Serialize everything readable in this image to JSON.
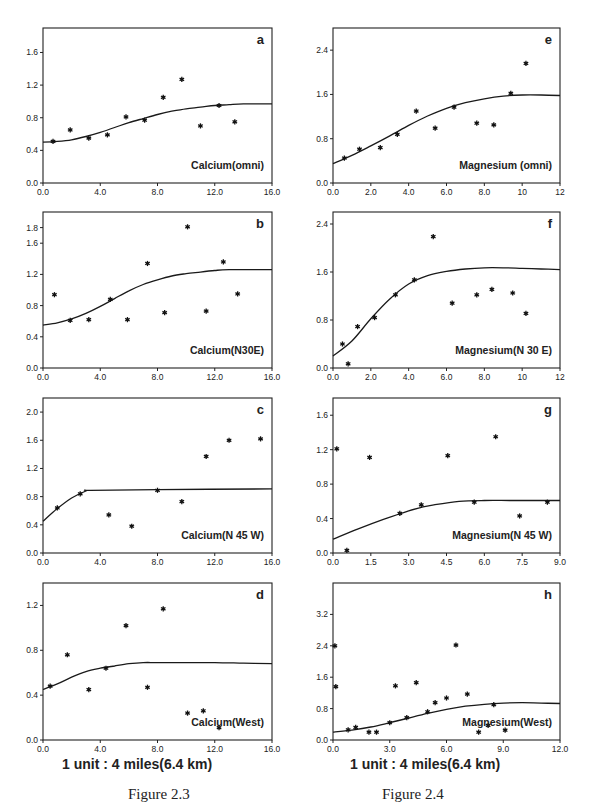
{
  "captions": {
    "left_scale": "1 unit : 4 miles(6.4 km)",
    "right_scale": "1 unit : 4 miles(6.4 km)",
    "left_figure": "Figure 2.3",
    "right_figure": "Figure 2.4"
  },
  "chart_data": [
    {
      "id": "a",
      "type": "scatter",
      "title": "Calcium(omni)",
      "panel_label": "a",
      "box": {
        "x0": 43,
        "x1": 272,
        "y_top": 28,
        "y_bottom": 183
      },
      "xlim": [
        0,
        16
      ],
      "ylim": [
        0,
        1.9
      ],
      "xticks": [
        0,
        4,
        8,
        12,
        16
      ],
      "xtick_labels": [
        "0.0",
        "4.0",
        "8.0",
        "12.0",
        "16.0"
      ],
      "yticks": [
        0,
        0.4,
        0.8,
        1.2,
        1.6
      ],
      "ytick_labels": [
        "0.0",
        "0.4",
        "0.8",
        "1.2",
        "1.6"
      ],
      "points": [
        [
          0.7,
          0.51
        ],
        [
          1.9,
          0.65
        ],
        [
          3.2,
          0.55
        ],
        [
          4.5,
          0.59
        ],
        [
          5.8,
          0.81
        ],
        [
          7.1,
          0.77
        ],
        [
          8.4,
          1.05
        ],
        [
          9.7,
          1.27
        ],
        [
          11.0,
          0.7
        ],
        [
          12.3,
          0.95
        ],
        [
          13.4,
          0.75
        ]
      ],
      "curve": [
        [
          0,
          0.5
        ],
        [
          1,
          0.51
        ],
        [
          2,
          0.53
        ],
        [
          3,
          0.57
        ],
        [
          4,
          0.62
        ],
        [
          5,
          0.68
        ],
        [
          6,
          0.74
        ],
        [
          7,
          0.79
        ],
        [
          8,
          0.84
        ],
        [
          9,
          0.88
        ],
        [
          10,
          0.91
        ],
        [
          11,
          0.93
        ],
        [
          12,
          0.95
        ],
        [
          13,
          0.96
        ],
        [
          14,
          0.97
        ],
        [
          16,
          0.97
        ]
      ]
    },
    {
      "id": "b",
      "type": "scatter",
      "title": "Calcium(N30E)",
      "panel_label": "b",
      "box": {
        "x0": 43,
        "x1": 272,
        "y_top": 212,
        "y_bottom": 368
      },
      "xlim": [
        0,
        16
      ],
      "ylim": [
        0,
        2.0
      ],
      "xticks": [
        0,
        4,
        8,
        12,
        16
      ],
      "xtick_labels": [
        "0.0",
        "4.0",
        "8.0",
        "12.0",
        "16.0"
      ],
      "yticks": [
        0,
        0.4,
        0.8,
        1.2,
        1.6,
        1.8
      ],
      "ytick_labels": [
        "0.0",
        "0.4",
        "0.8",
        "1.2",
        "1.6",
        "1.8"
      ],
      "points": [
        [
          0.8,
          0.94
        ],
        [
          1.9,
          0.61
        ],
        [
          3.2,
          0.62
        ],
        [
          4.7,
          0.88
        ],
        [
          5.9,
          0.62
        ],
        [
          7.3,
          1.34
        ],
        [
          8.5,
          0.71
        ],
        [
          10.1,
          1.81
        ],
        [
          11.4,
          0.73
        ],
        [
          12.6,
          1.36
        ],
        [
          13.6,
          0.95
        ]
      ],
      "curve": [
        [
          0,
          0.55
        ],
        [
          1,
          0.58
        ],
        [
          2,
          0.63
        ],
        [
          3,
          0.7
        ],
        [
          4,
          0.79
        ],
        [
          5,
          0.89
        ],
        [
          6,
          0.99
        ],
        [
          7,
          1.07
        ],
        [
          8,
          1.13
        ],
        [
          9,
          1.18
        ],
        [
          10,
          1.21
        ],
        [
          11,
          1.23
        ],
        [
          12,
          1.25
        ],
        [
          13,
          1.26
        ],
        [
          16,
          1.26
        ]
      ]
    },
    {
      "id": "c",
      "type": "scatter",
      "title": "Calcium(N 45 W)",
      "panel_label": "c",
      "box": {
        "x0": 43,
        "x1": 272,
        "y_top": 398,
        "y_bottom": 553
      },
      "xlim": [
        0,
        16
      ],
      "ylim": [
        0,
        2.2
      ],
      "xticks": [
        0,
        4,
        8,
        12,
        16
      ],
      "xtick_labels": [
        "0.0",
        "4.0",
        "8.0",
        "12.0",
        "16.0"
      ],
      "yticks": [
        0,
        0.4,
        0.8,
        1.2,
        1.6,
        2.0
      ],
      "ytick_labels": [
        "0.0",
        "0.4",
        "0.8",
        "1.2",
        "1.6",
        "2.0"
      ],
      "points": [
        [
          1.0,
          0.64
        ],
        [
          2.6,
          0.84
        ],
        [
          4.6,
          0.54
        ],
        [
          6.2,
          0.38
        ],
        [
          8.0,
          0.89
        ],
        [
          9.7,
          0.73
        ],
        [
          11.4,
          1.37
        ],
        [
          13.0,
          1.6
        ],
        [
          15.2,
          1.62
        ]
      ],
      "curve": [
        [
          0,
          0.45
        ],
        [
          1,
          0.63
        ],
        [
          2,
          0.78
        ],
        [
          3,
          0.88
        ],
        [
          3.3,
          0.89
        ],
        [
          8,
          0.9
        ],
        [
          16,
          0.91
        ]
      ]
    },
    {
      "id": "d",
      "type": "scatter",
      "title": "Calcium(West)",
      "panel_label": "d",
      "box": {
        "x0": 43,
        "x1": 272,
        "y_top": 583,
        "y_bottom": 740
      },
      "xlim": [
        0,
        16
      ],
      "ylim": [
        0,
        1.4
      ],
      "xticks": [
        0,
        4,
        8,
        12,
        16
      ],
      "xtick_labels": [
        "0.0",
        "4.0",
        "8.0",
        "12.0",
        "16.0"
      ],
      "yticks": [
        0,
        0.4,
        0.8,
        1.2
      ],
      "ytick_labels": [
        "0.0",
        "0.4",
        "0.8",
        "1.2"
      ],
      "points": [
        [
          0.5,
          0.48
        ],
        [
          1.7,
          0.76
        ],
        [
          3.2,
          0.45
        ],
        [
          4.4,
          0.64
        ],
        [
          5.8,
          1.02
        ],
        [
          7.3,
          0.47
        ],
        [
          8.4,
          1.17
        ],
        [
          10.1,
          0.24
        ],
        [
          11.2,
          0.26
        ],
        [
          12.3,
          0.11
        ]
      ],
      "curve": [
        [
          0,
          0.45
        ],
        [
          1,
          0.5
        ],
        [
          2,
          0.56
        ],
        [
          3,
          0.61
        ],
        [
          4,
          0.64
        ],
        [
          5,
          0.66
        ],
        [
          6,
          0.68
        ],
        [
          7,
          0.69
        ],
        [
          8,
          0.69
        ],
        [
          10,
          0.69
        ],
        [
          12,
          0.69
        ],
        [
          14,
          0.685
        ],
        [
          16,
          0.68
        ]
      ]
    },
    {
      "id": "e",
      "type": "scatter",
      "title": "Magnesium (omni)",
      "panel_label": "e",
      "box": {
        "x0": 333,
        "x1": 560,
        "y_top": 28,
        "y_bottom": 183
      },
      "xlim": [
        0,
        12
      ],
      "ylim": [
        0,
        2.8
      ],
      "xticks": [
        0,
        2,
        4,
        6,
        8,
        10,
        12
      ],
      "xtick_labels": [
        "0.0",
        "2.0",
        "4.0",
        "6.0",
        "8.0",
        "10",
        "12"
      ],
      "yticks": [
        0,
        0.8,
        1.6,
        2.4
      ],
      "ytick_labels": [
        "0.0",
        "0.8",
        "1.6",
        "2.4"
      ],
      "points": [
        [
          0.6,
          0.45
        ],
        [
          1.4,
          0.61
        ],
        [
          2.5,
          0.64
        ],
        [
          3.4,
          0.88
        ],
        [
          4.4,
          1.3
        ],
        [
          5.4,
          0.99
        ],
        [
          6.4,
          1.37
        ],
        [
          7.6,
          1.08
        ],
        [
          8.5,
          1.05
        ],
        [
          9.4,
          1.62
        ],
        [
          10.2,
          2.16
        ]
      ],
      "curve": [
        [
          0,
          0.35
        ],
        [
          1,
          0.5
        ],
        [
          2,
          0.67
        ],
        [
          3,
          0.85
        ],
        [
          4,
          1.04
        ],
        [
          5,
          1.21
        ],
        [
          6,
          1.35
        ],
        [
          7,
          1.45
        ],
        [
          8,
          1.52
        ],
        [
          9,
          1.57
        ],
        [
          10,
          1.59
        ],
        [
          11,
          1.59
        ],
        [
          12,
          1.58
        ]
      ]
    },
    {
      "id": "f",
      "type": "scatter",
      "title": "Magnesium(N 30 E)",
      "panel_label": "f",
      "box": {
        "x0": 333,
        "x1": 560,
        "y_top": 212,
        "y_bottom": 368
      },
      "xlim": [
        0,
        12
      ],
      "ylim": [
        0,
        2.6
      ],
      "xticks": [
        0,
        2,
        4,
        6,
        8,
        10,
        12
      ],
      "xtick_labels": [
        "0.0",
        "2.0",
        "4.0",
        "6.0",
        "8.0",
        "10",
        "12"
      ],
      "yticks": [
        0,
        0.8,
        1.6,
        2.4
      ],
      "ytick_labels": [
        "0.0",
        "0.8",
        "1.6",
        "2.4"
      ],
      "points": [
        [
          0.5,
          0.4
        ],
        [
          0.8,
          0.07
        ],
        [
          1.3,
          0.69
        ],
        [
          2.2,
          0.84
        ],
        [
          3.3,
          1.22
        ],
        [
          4.3,
          1.47
        ],
        [
          5.3,
          2.19
        ],
        [
          6.3,
          1.08
        ],
        [
          7.6,
          1.22
        ],
        [
          8.4,
          1.31
        ],
        [
          9.5,
          1.25
        ],
        [
          10.2,
          0.91
        ]
      ],
      "curve": [
        [
          0,
          0.2
        ],
        [
          1,
          0.45
        ],
        [
          2,
          0.82
        ],
        [
          3,
          1.15
        ],
        [
          4,
          1.4
        ],
        [
          5,
          1.54
        ],
        [
          6,
          1.61
        ],
        [
          7,
          1.65
        ],
        [
          8,
          1.67
        ],
        [
          9,
          1.67
        ],
        [
          10,
          1.66
        ],
        [
          11,
          1.65
        ],
        [
          12,
          1.64
        ]
      ]
    },
    {
      "id": "g",
      "type": "scatter",
      "title": "Magnesium(N 45 W)",
      "panel_label": "g",
      "box": {
        "x0": 333,
        "x1": 560,
        "y_top": 398,
        "y_bottom": 553
      },
      "xlim": [
        0,
        9
      ],
      "ylim": [
        0,
        1.8
      ],
      "xticks": [
        0,
        1.5,
        3,
        4.5,
        6,
        7.5,
        9
      ],
      "xtick_labels": [
        "0.0",
        "1.5",
        "3.0",
        "4.5",
        "6.0",
        "7.5",
        "9.0"
      ],
      "yticks": [
        0,
        0.4,
        0.8,
        1.2,
        1.6
      ],
      "ytick_labels": [
        "0.0",
        "0.4",
        "0.8",
        "1.2",
        "1.6"
      ],
      "points": [
        [
          0.15,
          1.21
        ],
        [
          0.55,
          0.03
        ],
        [
          1.45,
          1.11
        ],
        [
          2.65,
          0.46
        ],
        [
          3.5,
          0.56
        ],
        [
          4.55,
          1.13
        ],
        [
          5.6,
          0.59
        ],
        [
          6.45,
          1.35
        ],
        [
          7.4,
          0.43
        ],
        [
          8.5,
          0.59
        ]
      ],
      "curve": [
        [
          0,
          0.16
        ],
        [
          1,
          0.28
        ],
        [
          2,
          0.39
        ],
        [
          3,
          0.49
        ],
        [
          3.5,
          0.53
        ],
        [
          4,
          0.56
        ],
        [
          5,
          0.6
        ],
        [
          6,
          0.61
        ],
        [
          7,
          0.61
        ],
        [
          8,
          0.61
        ],
        [
          9,
          0.61
        ]
      ]
    },
    {
      "id": "h",
      "type": "scatter",
      "title": "Magnesium(West)",
      "panel_label": "h",
      "box": {
        "x0": 333,
        "x1": 560,
        "y_top": 583,
        "y_bottom": 740
      },
      "xlim": [
        0,
        12
      ],
      "ylim": [
        0,
        4.0
      ],
      "xticks": [
        0,
        3,
        6,
        9,
        12
      ],
      "xtick_labels": [
        "0.0",
        "3.0",
        "6.0",
        "9.0",
        "12.0"
      ],
      "yticks": [
        0,
        0.8,
        1.6,
        2.4,
        3.2
      ],
      "ytick_labels": [
        "0.0",
        "0.8",
        "1.6",
        "2.4",
        "3.2"
      ],
      "points": [
        [
          0.1,
          2.4
        ],
        [
          0.15,
          1.36
        ],
        [
          0.8,
          0.26
        ],
        [
          1.2,
          0.32
        ],
        [
          1.9,
          0.2
        ],
        [
          2.3,
          0.2
        ],
        [
          3.0,
          0.44
        ],
        [
          3.3,
          1.38
        ],
        [
          3.9,
          0.57
        ],
        [
          4.4,
          1.46
        ],
        [
          5.0,
          0.72
        ],
        [
          5.4,
          0.95
        ],
        [
          6.0,
          1.07
        ],
        [
          6.5,
          2.42
        ],
        [
          7.1,
          1.17
        ],
        [
          7.7,
          0.2
        ],
        [
          8.2,
          0.37
        ],
        [
          8.5,
          0.9
        ],
        [
          9.1,
          0.25
        ]
      ],
      "curve": [
        [
          0,
          0.2
        ],
        [
          1,
          0.25
        ],
        [
          2,
          0.33
        ],
        [
          3,
          0.44
        ],
        [
          4,
          0.56
        ],
        [
          5,
          0.68
        ],
        [
          6,
          0.78
        ],
        [
          7,
          0.86
        ],
        [
          8,
          0.91
        ],
        [
          9,
          0.94
        ],
        [
          10,
          0.95
        ],
        [
          11,
          0.94
        ],
        [
          12,
          0.93
        ]
      ]
    }
  ]
}
